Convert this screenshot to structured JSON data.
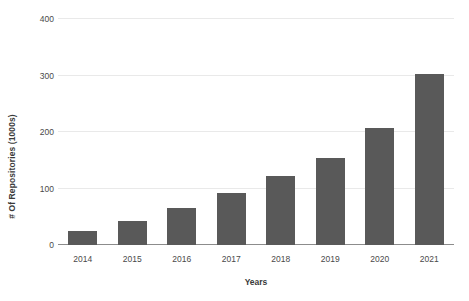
{
  "chart_data": {
    "type": "bar",
    "title": "",
    "subtitle": "",
    "xlabel": "Years",
    "ylabel": "# Of Repositories (1000s)",
    "categories": [
      "2014",
      "2015",
      "2016",
      "2017",
      "2018",
      "2019",
      "2020",
      "2021"
    ],
    "values": [
      25,
      43,
      65,
      92,
      122,
      154,
      207,
      303
    ],
    "series": [
      {
        "name": "# Of Repositories (1000s)",
        "values": [
          25,
          43,
          65,
          92,
          122,
          154,
          207,
          303
        ]
      }
    ],
    "ylim": [
      0,
      400
    ],
    "yticks": [
      0,
      100,
      200,
      300,
      400
    ],
    "ytick_labels": [
      "0",
      "100",
      "200",
      "300",
      "400"
    ],
    "grid": "horizontal",
    "legend": "none",
    "annotations": [],
    "colors": {
      "bar_fill": "#595959",
      "gridline": "#e9e9e9",
      "axis_line": "#8c8c8c",
      "tick_text": "#4a4a4a",
      "axis_title_text": "#3a3a3a",
      "background": "#ffffff"
    }
  }
}
